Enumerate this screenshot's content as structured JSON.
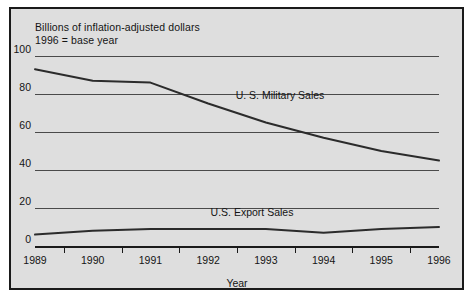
{
  "chart_data": {
    "type": "line",
    "title": "Billions of inflation-adjusted dollars",
    "subtitle": "1996 = base year",
    "xlabel": "Year",
    "ylabel": "",
    "categories": [
      "1989",
      "1990",
      "1991",
      "1992",
      "1993",
      "1994",
      "1995",
      "1996"
    ],
    "x": [
      1989,
      1990,
      1991,
      1992,
      1993,
      1994,
      1995,
      1996
    ],
    "ylim": [
      0,
      100
    ],
    "xlim": [
      1989,
      1996
    ],
    "yticks": [
      0,
      20,
      40,
      60,
      80,
      100
    ],
    "ytick_labels": [
      "0",
      "20",
      "40",
      "60",
      "80",
      "100"
    ],
    "grid": "horizontal",
    "legend": "inline-labels",
    "series": [
      {
        "name": "U. S. Military Sales",
        "values": [
          93,
          87,
          86,
          75,
          65,
          57,
          50,
          45
        ]
      },
      {
        "name": "U.S. Export Sales",
        "values": [
          6,
          8,
          9,
          9,
          9,
          7,
          9,
          10
        ]
      }
    ],
    "annotations": [
      {
        "text": "U. S. Military Sales",
        "series": "U. S. Military Sales"
      },
      {
        "text": "U.S. Export Sales",
        "series": "U.S. Export Sales"
      }
    ]
  },
  "colors": {
    "background": "#dedede",
    "frame": "#1a1a1a",
    "gridline": "#4a4a4a",
    "line": "#2b2b2b",
    "text": "#141414"
  }
}
